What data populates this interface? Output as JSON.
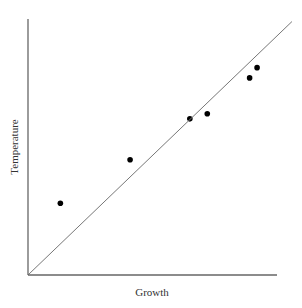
{
  "chart_data": {
    "type": "scatter",
    "title": "",
    "xlabel": "Growth",
    "ylabel": "Temperature",
    "xlim": [
      0,
      10
    ],
    "ylim": [
      0,
      10
    ],
    "grid": false,
    "legend": null,
    "tick_labels": false,
    "series": [
      {
        "name": "observations",
        "kind": "scatter",
        "points": [
          {
            "x": 1.3,
            "y": 2.8
          },
          {
            "x": 4.1,
            "y": 4.5
          },
          {
            "x": 6.5,
            "y": 6.1
          },
          {
            "x": 7.2,
            "y": 6.3
          },
          {
            "x": 8.9,
            "y": 7.7
          },
          {
            "x": 9.2,
            "y": 8.1
          }
        ]
      },
      {
        "name": "reference-line",
        "kind": "line",
        "points": [
          {
            "x": 0,
            "y": 0
          },
          {
            "x": 10.6,
            "y": 9.9
          }
        ]
      }
    ],
    "colors": {
      "axis": "#666666",
      "line": "#777777",
      "points": "#000000",
      "text": "#333333"
    }
  }
}
